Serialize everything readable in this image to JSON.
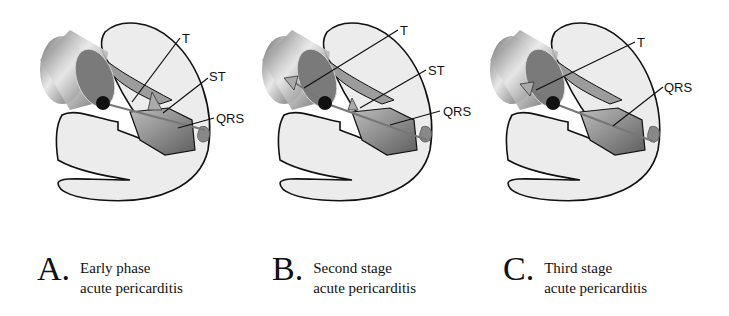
{
  "panels": [
    {
      "id": "A",
      "letter": "A.",
      "caption_line1": "Early phase",
      "caption_line2": "acute pericarditis",
      "labels": {
        "t": "T",
        "st": "ST",
        "qrs": "QRS"
      }
    },
    {
      "id": "B",
      "letter": "B.",
      "caption_line1": "Second stage",
      "caption_line2": "acute pericarditis",
      "labels": {
        "t": "T",
        "st": "ST",
        "qrs": "QRS"
      }
    },
    {
      "id": "C",
      "letter": "C.",
      "caption_line1": "Third stage",
      "caption_line2": "acute pericarditis",
      "labels": {
        "t": "T",
        "qrs": "QRS"
      }
    }
  ],
  "colors": {
    "outline": "#111111",
    "heart_fill": "#ececec",
    "septum_fill": "#8a8a8a",
    "cylinder": "#9a9a9a"
  }
}
